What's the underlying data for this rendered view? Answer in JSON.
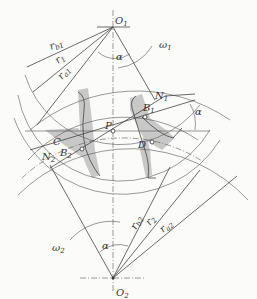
{
  "diagram": {
    "type": "gear meshing (involute gear pair engagement)",
    "points": {
      "O1": {
        "label": "O",
        "sub": "1"
      },
      "O2": {
        "label": "O",
        "sub": "2"
      },
      "P": {
        "label": "P"
      },
      "N1": {
        "label": "N",
        "sub": "1"
      },
      "N2": {
        "label": "N",
        "sub": "2"
      },
      "B1": {
        "label": "B",
        "sub": "1"
      },
      "B2": {
        "label": "B",
        "sub": "2"
      },
      "C": {
        "label": "C"
      },
      "D": {
        "label": "D"
      }
    },
    "radii": {
      "rb1": {
        "label": "r",
        "sub": "b1"
      },
      "r1": {
        "label": "r",
        "sub": "1"
      },
      "ra1": {
        "label": "r",
        "sub": "a1"
      },
      "rb2": {
        "label": "r",
        "sub": "b2"
      },
      "r2": {
        "label": "r",
        "sub": "2"
      },
      "ra2": {
        "label": "r",
        "sub": "a2"
      }
    },
    "angles": {
      "alpha_top": "α",
      "alpha_right": "α",
      "alpha_bottom": "α"
    },
    "rotation": {
      "omega1": {
        "label": "ω",
        "sub": "1"
      },
      "omega2": {
        "label": "ω",
        "sub": "2"
      }
    }
  }
}
